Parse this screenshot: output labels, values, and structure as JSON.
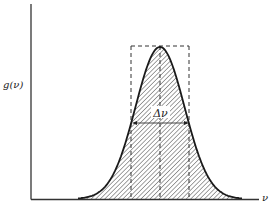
{
  "diagram": {
    "type": "lineshape",
    "y_axis_label": "g(ν)",
    "x_axis_label": "ν",
    "width_label": "Δν",
    "colors": {
      "line": "#1a1a1a",
      "axis": "#333333",
      "hatch": "#555555",
      "background": "#ffffff"
    },
    "curve": {
      "shape": "gaussian-like profile",
      "center_x": 160,
      "peak_y": 47,
      "baseline_y": 199,
      "start_x": 78,
      "end_x": 242,
      "fill": "diagonal hatching"
    },
    "dashed_box": {
      "x1": 131,
      "x2": 189,
      "top": 46,
      "bottom": 199
    },
    "width_arrow": {
      "y": 123,
      "x1": 132,
      "x2": 189
    }
  }
}
